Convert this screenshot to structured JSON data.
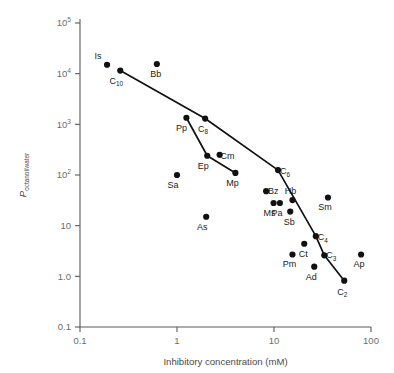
{
  "chart_data": {
    "type": "scatter",
    "title": "",
    "xlabel": "Inhibitory concentration (mM)",
    "ylabel": "P octanol/water",
    "ylabel_main": "P",
    "ylabel_subscript": "octanol/water",
    "xscale": "log",
    "yscale": "log",
    "xlim": [
      0.1,
      100
    ],
    "ylim": [
      0.1,
      100000
    ],
    "grid": false,
    "legend": "none",
    "xticks": [
      "0.1",
      "1",
      "10",
      "100"
    ],
    "xtick_values": [
      0.1,
      1,
      10,
      100
    ],
    "yticks": [
      "10⁵",
      "10⁴",
      "10³",
      "10²",
      "10",
      "1.0",
      "0.1"
    ],
    "ytick_values": [
      100000,
      10000,
      1000,
      100,
      10,
      1.0,
      0.1
    ],
    "ytick_parts": [
      {
        "base": "10",
        "sup": "5"
      },
      {
        "base": "10",
        "sup": "4"
      },
      {
        "base": "10",
        "sup": "3"
      },
      {
        "base": "10",
        "sup": "2"
      },
      {
        "base": "10",
        "sup": ""
      },
      {
        "base": "1.0",
        "sup": ""
      },
      {
        "base": "0.1",
        "sup": ""
      }
    ],
    "points": [
      {
        "label": "Is",
        "base": "Is",
        "sub": "",
        "x": 0.19,
        "y": 15000,
        "lx": -9,
        "ly": -6
      },
      {
        "label": "C10",
        "base": "C",
        "sub": "10",
        "x": 0.26,
        "y": 11500,
        "lx": -4,
        "ly": 13
      },
      {
        "label": "Bb",
        "base": "Bb",
        "sub": "",
        "x": 0.62,
        "y": 15500,
        "lx": -1,
        "ly": 13
      },
      {
        "label": "Pp",
        "base": "Pp",
        "sub": "",
        "x": 1.25,
        "y": 1350,
        "lx": -5,
        "ly": 13
      },
      {
        "label": "C8",
        "base": "C",
        "sub": "8",
        "x": 1.95,
        "y": 1300,
        "lx": -2,
        "ly": 13
      },
      {
        "label": "Ep",
        "base": "Ep",
        "sub": "",
        "x": 2.05,
        "y": 240,
        "lx": -4,
        "ly": 13
      },
      {
        "label": "Cm",
        "base": "Cm",
        "sub": "",
        "x": 2.75,
        "y": 250,
        "lx": 8,
        "ly": 4
      },
      {
        "label": "Mp",
        "base": "Mp",
        "sub": "",
        "x": 4.0,
        "y": 110,
        "lx": -3,
        "ly": 13
      },
      {
        "label": "Sa",
        "base": "Sa",
        "sub": "",
        "x": 1.0,
        "y": 100,
        "lx": -4,
        "ly": 13
      },
      {
        "label": "C6",
        "base": "C",
        "sub": "6",
        "x": 11.0,
        "y": 125,
        "lx": 7,
        "ly": 4
      },
      {
        "label": "Bz",
        "base": "Bz",
        "sub": "",
        "x": 8.3,
        "y": 48,
        "lx": 7,
        "ly": 3
      },
      {
        "label": "Ms",
        "base": "Ms",
        "sub": "",
        "x": 9.9,
        "y": 28,
        "lx": -4,
        "ly": 13
      },
      {
        "label": "Pa",
        "base": "Pa",
        "sub": "",
        "x": 11.5,
        "y": 28,
        "lx": -3,
        "ly": 13
      },
      {
        "label": "Hb",
        "base": "Hb",
        "sub": "",
        "x": 15.5,
        "y": 32,
        "lx": -2,
        "ly": -6
      },
      {
        "label": "Sb",
        "base": "Sb",
        "sub": "",
        "x": 14.7,
        "y": 19,
        "lx": -1,
        "ly": 13
      },
      {
        "label": "As",
        "base": "As",
        "sub": "",
        "x": 2.0,
        "y": 15,
        "lx": -4,
        "ly": 13
      },
      {
        "label": "Sm",
        "base": "Sm",
        "sub": "",
        "x": 36.0,
        "y": 36,
        "lx": -3,
        "ly": 13
      },
      {
        "label": "C4",
        "base": "C",
        "sub": "4",
        "x": 27.0,
        "y": 6.2,
        "lx": 7,
        "ly": 4
      },
      {
        "label": "Ct",
        "base": "Ct",
        "sub": "",
        "x": 20.5,
        "y": 4.4,
        "lx": -1,
        "ly": 13
      },
      {
        "label": "C3",
        "base": "C",
        "sub": "3",
        "x": 33.0,
        "y": 2.6,
        "lx": 7,
        "ly": 3
      },
      {
        "label": "Pm",
        "base": "Pm",
        "sub": "",
        "x": 15.5,
        "y": 2.7,
        "lx": -3,
        "ly": 13
      },
      {
        "label": "Ap",
        "base": "Ap",
        "sub": "",
        "x": 79.0,
        "y": 2.7,
        "lx": -2,
        "ly": 13
      },
      {
        "label": "Ad",
        "base": "Ad",
        "sub": "",
        "x": 26.0,
        "y": 1.55,
        "lx": -3,
        "ly": 13
      },
      {
        "label": "C2",
        "base": "C",
        "sub": "2",
        "x": 53.0,
        "y": 0.82,
        "lx": -2,
        "ly": 14
      }
    ],
    "series": [
      {
        "name": "alkanol-series-upper",
        "points": [
          {
            "label": "C10",
            "x": 0.26,
            "y": 11500
          },
          {
            "label": "C8",
            "x": 1.95,
            "y": 1300
          },
          {
            "label": "C6",
            "x": 11.0,
            "y": 125
          },
          {
            "label": "C4",
            "x": 27.0,
            "y": 6.2
          },
          {
            "label": "C3",
            "x": 33.0,
            "y": 2.6
          },
          {
            "label": "C2",
            "x": 53.0,
            "y": 0.82
          }
        ]
      },
      {
        "name": "anesthetic-series-lower",
        "points": [
          {
            "label": "Pp",
            "x": 1.25,
            "y": 1350
          },
          {
            "label": "Ep",
            "x": 2.05,
            "y": 240
          },
          {
            "label": "Mp",
            "x": 4.0,
            "y": 110
          }
        ]
      }
    ]
  },
  "colors": {
    "point": "#111111",
    "line": "#111111",
    "axis": "#5a5a5a",
    "tick_text": "#6d6d6d",
    "label_text": "#1a1a1a",
    "background": "#ffffff"
  }
}
